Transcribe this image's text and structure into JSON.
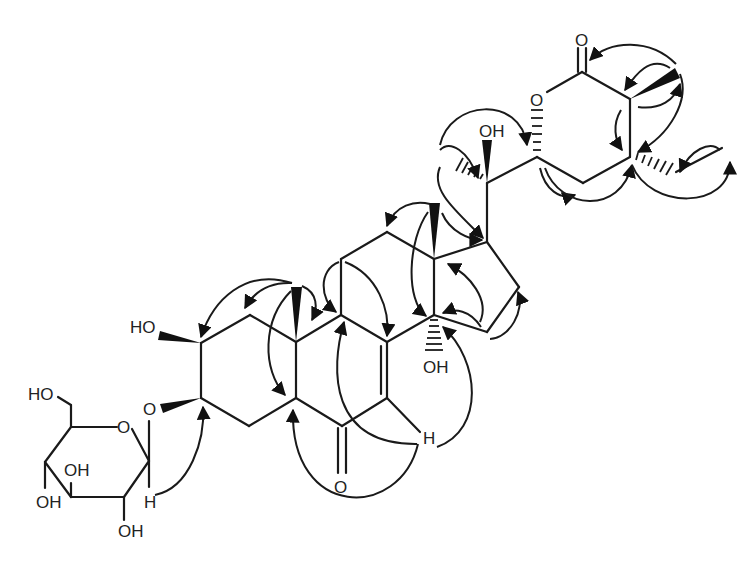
{
  "figure": {
    "type": "chemical-structure-with-HMBC-correlations",
    "arrow_color": "#1a1a1a",
    "bond_color": "#1a1a1a"
  },
  "labels": {
    "ho_c2": "HO",
    "o_glyco": "O",
    "sugar_ho_c6": "HO",
    "sugar_ring_o": "O",
    "sugar_oh_c3": "OH",
    "sugar_oh_c4": "OH",
    "sugar_oh_c2": "OH",
    "sugar_h_anomeric": "H",
    "ketone_o": "O",
    "h_c7": "H",
    "oh_c14": "OH",
    "oh_c20": "OH",
    "lactone_ring_o": "O",
    "lactone_carbonyl_o": "O"
  }
}
